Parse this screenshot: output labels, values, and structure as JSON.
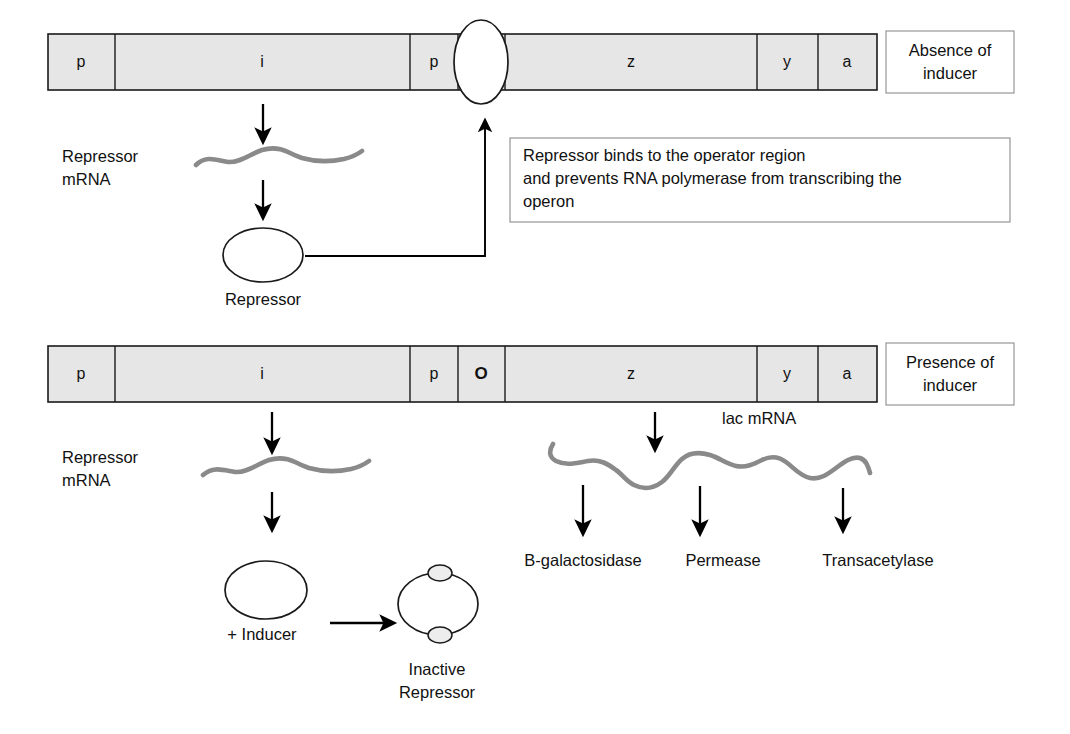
{
  "figure": {
    "colors": {
      "gene_bar_fill": "#e6e6e6",
      "gene_bar_stroke": "#1a1a1a",
      "mrna_strand": "#8a8a8a",
      "arrow": "#000000",
      "callout_border": "#8d8d8d",
      "background": "#ffffff"
    }
  },
  "panels": [
    {
      "id": "absence",
      "condition_label": "Absence of\ninducer",
      "condition_label_line1": "Absence of",
      "condition_label_line2": "inducer",
      "operon_segments": [
        {
          "label": "p",
          "name": "promoter-i"
        },
        {
          "label": "i",
          "name": "gene-i"
        },
        {
          "label": "p",
          "name": "promoter-lac"
        },
        {
          "label": "",
          "name": "operator-blocked"
        },
        {
          "label": "z",
          "name": "gene-z"
        },
        {
          "label": "y",
          "name": "gene-y"
        },
        {
          "label": "a",
          "name": "gene-a"
        }
      ],
      "mrna_label_line1": "Repressor",
      "mrna_label_line2": "mRNA",
      "protein_label": "Repressor",
      "callout_line1": "Repressor binds to the operator region",
      "callout_line2": "and prevents RNA polymerase from transcribing the",
      "callout_line3": "operon"
    },
    {
      "id": "presence",
      "condition_label_line1": "Presence  of",
      "condition_label_line2": "inducer",
      "operon_segments": [
        {
          "label": "p",
          "name": "promoter-i"
        },
        {
          "label": "i",
          "name": "gene-i"
        },
        {
          "label": "p",
          "name": "promoter-lac"
        },
        {
          "label": "O",
          "name": "operator",
          "bold": true
        },
        {
          "label": "z",
          "name": "gene-z"
        },
        {
          "label": "y",
          "name": "gene-y"
        },
        {
          "label": "a",
          "name": "gene-a"
        }
      ],
      "mrna_label_line1": "Repressor",
      "mrna_label_line2": "mRNA",
      "lac_mrna_label_italic": "lac",
      "lac_mrna_label_rest": " mRNA",
      "inducer_label": "+ Inducer",
      "inactive_label_line1": "Inactive",
      "inactive_label_line2": "Repressor",
      "products": [
        "B-galactosidase",
        "Permease",
        "Transacetylase"
      ]
    }
  ]
}
